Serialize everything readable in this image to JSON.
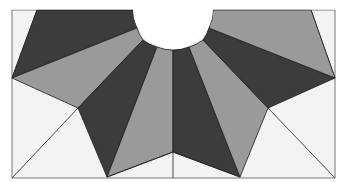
{
  "diagram": {
    "type": "quilt-block",
    "colors": {
      "background": "#ffffff",
      "block_fill": "#f2f2f2",
      "dark": "#3c3c3c",
      "light": "#9a9a9a",
      "line": "#1e1e1e",
      "border": "#7a7a7a"
    },
    "border": {
      "x": 12,
      "y": 10,
      "width": 323,
      "height": 168
    },
    "center_cutout": {
      "cx": 173,
      "cy": 10,
      "r": 40
    },
    "wedges": [
      {
        "id": 1,
        "shade": "dark",
        "points": "37,10 133,10 A 137,28 12,78"
      },
      {
        "id": 2,
        "shade": "light",
        "points": "12,78 137,28 A 143,42 78,108"
      },
      {
        "id": 3,
        "shade": "dark",
        "points": "78,108 143,42 A 157,50 107,177"
      },
      {
        "id": 4,
        "shade": "light",
        "points": "107,177 157,50 A 173,50 173,152"
      },
      {
        "id": 5,
        "shade": "dark",
        "points": "173,152 173,50 A 189,50 240,177"
      },
      {
        "id": 6,
        "shade": "light",
        "points": "240,177 189,50 A 203,42 268,108"
      },
      {
        "id": 7,
        "shade": "dark",
        "points": "268,108 203,42 A 209,28 335,78"
      },
      {
        "id": 8,
        "shade": "light",
        "points": "335,78 209,28 A 213,10 311,10"
      }
    ]
  }
}
